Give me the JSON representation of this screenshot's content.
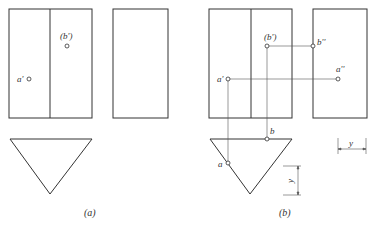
{
  "figure": {
    "panel_a": {
      "caption": "(a)",
      "labels": {
        "a_prime": "a'",
        "b_prime": "(b')"
      }
    },
    "panel_b": {
      "caption": "(b)",
      "labels": {
        "b_prime": "(b')",
        "b_double_prime": "b''",
        "a_prime": "a'",
        "a_double_prime": "a''",
        "b": "b",
        "a": "a",
        "y_horizontal": "y",
        "y_vertical": "y"
      }
    },
    "colors": {
      "stroke": "#333333",
      "thin": "#555555",
      "background": "#ffffff"
    }
  }
}
